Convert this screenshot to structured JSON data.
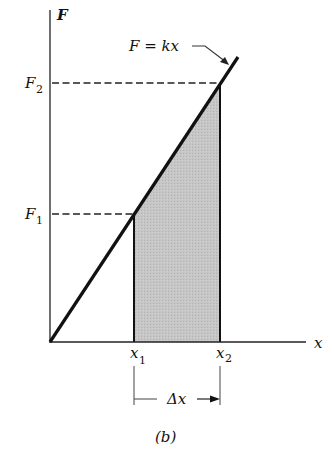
{
  "diagram": {
    "axes": {
      "y_label": "F",
      "x_label": "x"
    },
    "line_label": "F = kx",
    "force_labels": [
      {
        "main": "F",
        "sub": "2"
      },
      {
        "main": "F",
        "sub": "1"
      }
    ],
    "position_labels": [
      {
        "main": "x",
        "sub": "1"
      },
      {
        "main": "x",
        "sub": "2"
      }
    ],
    "interval_label": "Δx",
    "caption": "(b)",
    "colors": {
      "ink": "#111111",
      "shade": "#c4c4c4",
      "background": "#ffffff"
    }
  }
}
